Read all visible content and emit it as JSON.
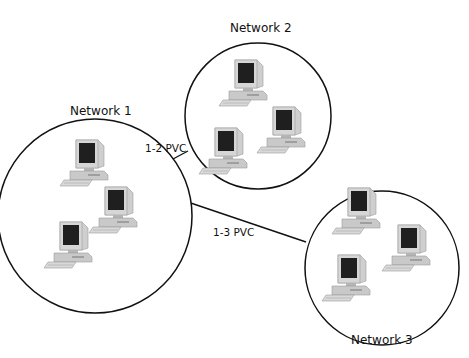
{
  "diagram": {
    "type": "network-topology",
    "networks": [
      {
        "id": "network-1",
        "label": "Network 1",
        "center": [
          95,
          216
        ],
        "radius": 97,
        "computers": 3
      },
      {
        "id": "network-2",
        "label": "Network 2",
        "center": [
          258,
          116
        ],
        "radius": 73,
        "computers": 3
      },
      {
        "id": "network-3",
        "label": "Network 3",
        "center": [
          382,
          268
        ],
        "radius": 77,
        "computers": 3
      }
    ],
    "links": [
      {
        "id": "pvc-1-2",
        "label": "1-2 PVC",
        "from": "network-1",
        "to": "network-2"
      },
      {
        "id": "pvc-1-3",
        "label": "1-3 PVC",
        "from": "network-1",
        "to": "network-3"
      }
    ],
    "colors": {
      "stroke": "#111111",
      "computer_body": "#c9c9c9",
      "computer_shade": "#a9a9a9",
      "screen": "#1f1f1f"
    }
  }
}
